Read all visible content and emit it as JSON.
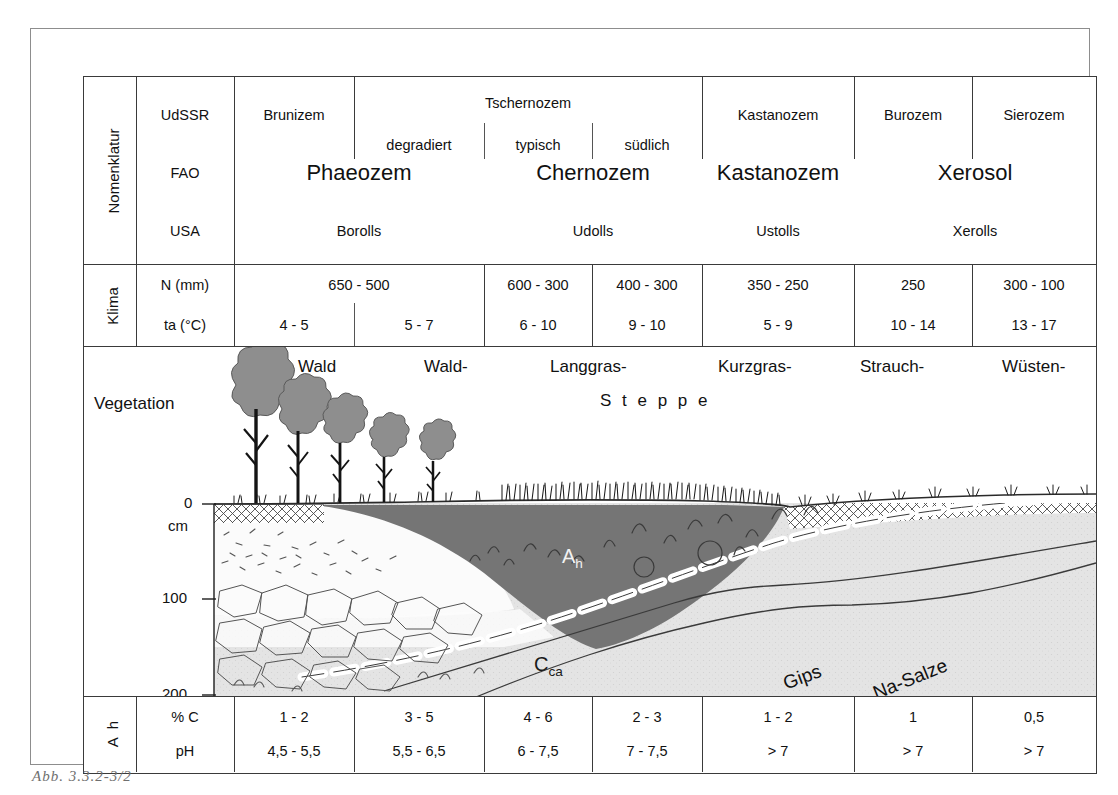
{
  "figure": {
    "caption": "Abb. 3.3.2-3/2"
  },
  "row_labels": {
    "nomenklatur": "Nomenklatur",
    "klima": "Klima",
    "vegetation": "Vegetation",
    "ah": "A h",
    "ah_line1": "A",
    "ah_line2": "h"
  },
  "sub_labels": {
    "udssr": "UdSSR",
    "fao": "FAO",
    "usa": "USA",
    "n_mm": "N (mm)",
    "ta_c": "ta (°C)",
    "pct_c": "% C",
    "ph": "pH"
  },
  "nomenclature": {
    "udssr": [
      {
        "label": "Brunizem"
      },
      {
        "label": "degradiert"
      },
      {
        "label": "typisch"
      },
      {
        "label": "südlich"
      },
      {
        "label": "Kastanozem"
      },
      {
        "label": "Burozem"
      },
      {
        "label": "Sierozem"
      }
    ],
    "udssr_group": {
      "label": "Tschernozem"
    },
    "fao": [
      {
        "label": "Phaeozem"
      },
      {
        "label": "Chernozem"
      },
      {
        "label": "Kastanozem"
      },
      {
        "label": "Xerosol"
      }
    ],
    "usa": [
      {
        "label": "Borolls"
      },
      {
        "label": "Udolls"
      },
      {
        "label": "Ustolls"
      },
      {
        "label": "Xerolls"
      }
    ]
  },
  "klima": {
    "n_mm": [
      "650 - 500",
      "600 - 300",
      "400 - 300",
      "350 - 250",
      "250",
      "300 - 100"
    ],
    "ta_c": [
      "4 - 5",
      "5 - 7",
      "6 - 10",
      "9 - 10",
      "5 - 9",
      "10 - 14",
      "13 - 17"
    ]
  },
  "vegetation": {
    "labels": [
      "Wald",
      "Wald-",
      "Langgras-",
      "Kurzgras-",
      "Strauch-",
      "Wüsten-"
    ],
    "steppe": "S t e p p e"
  },
  "profile": {
    "depth_unit": "cm",
    "depth_ticks": [
      "0",
      "100",
      "200"
    ],
    "horizons": [
      {
        "name": "Ah",
        "base": "A",
        "sub": "h"
      },
      {
        "name": "Cca",
        "base": "C",
        "sub": "ca"
      }
    ],
    "features": [
      {
        "label": "Gips"
      },
      {
        "label": "Na-Salze"
      }
    ]
  },
  "ah_table": {
    "pct_c": [
      "1 - 2",
      "3 - 5",
      "4 - 6",
      "2 - 3",
      "1 - 2",
      "1",
      "0,5"
    ],
    "ph": [
      "4,5 - 5,5",
      "5,5 - 6,5",
      "6 - 7,5",
      "7 - 7,5",
      "> 7",
      "> 7",
      "> 7"
    ]
  },
  "colors": {
    "ah_horizon": "#757575",
    "substrate": "#e2e2e2",
    "pale": "#f4f4f4",
    "tree_crown": "#8e8e8e",
    "line": "#3a3a3a"
  }
}
